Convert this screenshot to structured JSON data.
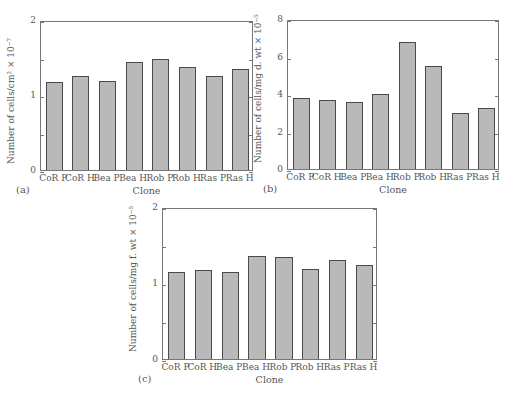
{
  "chart_data": [
    {
      "type": "bar",
      "panel": "(a)",
      "title": "",
      "xlabel": "Clone",
      "ylabel": "Number of cells/cm² × 10⁻⁷",
      "categories": [
        "CoR P",
        "CoR H",
        "Bea P",
        "Bea H",
        "Rob P",
        "Rob H",
        "Ras P",
        "Ras H"
      ],
      "values": [
        1.17,
        1.25,
        1.19,
        1.44,
        1.48,
        1.37,
        1.25,
        1.35
      ],
      "ylim": [
        0,
        2
      ],
      "yticks": [
        "0",
        "",
        "1",
        "",
        "2"
      ],
      "grid": false,
      "legend": null
    },
    {
      "type": "bar",
      "panel": "(b)",
      "title": "",
      "xlabel": "Clone",
      "ylabel": "Number of cells/mg d. wt × 10⁻⁵",
      "categories": [
        "CoR P",
        "CoR H",
        "Bea P",
        "Bea H",
        "Rob P",
        "Rob H",
        "Ras P",
        "Ras H"
      ],
      "values": [
        3.8,
        3.7,
        3.6,
        4.0,
        6.8,
        5.5,
        3.0,
        3.25
      ],
      "ylim": [
        0,
        8
      ],
      "yticks": [
        "0",
        "2",
        "4",
        "6",
        "8"
      ],
      "grid": false,
      "legend": null
    },
    {
      "type": "bar",
      "panel": "(c)",
      "title": "",
      "xlabel": "Clone",
      "ylabel": "Number of cells/mg f. wt × 10⁻⁵",
      "categories": [
        "CoR P",
        "CoR H",
        "Bea P",
        "Bea H",
        "Rob P",
        "Rob H",
        "Ras P",
        "Ras H"
      ],
      "values": [
        1.15,
        1.17,
        1.14,
        1.36,
        1.34,
        1.18,
        1.3,
        1.24
      ],
      "ylim": [
        0,
        2
      ],
      "yticks": [
        "0",
        "",
        "1",
        "",
        "2"
      ],
      "grid": false,
      "legend": null
    }
  ],
  "colors": {
    "bar_fill": "#b9b9b9",
    "bar_border": "#4a4a4a",
    "axis": "#777777"
  }
}
